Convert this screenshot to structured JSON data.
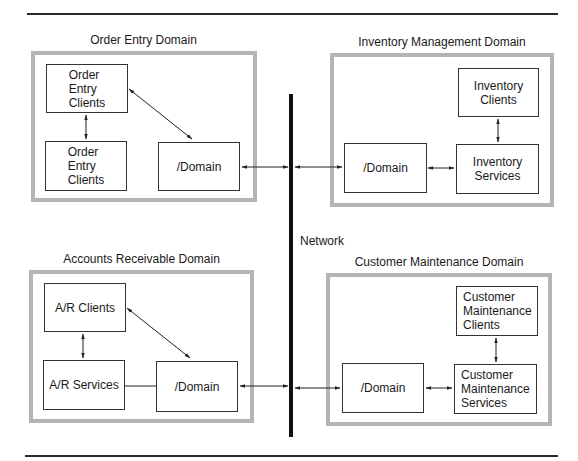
{
  "network": {
    "label": "Network"
  },
  "domains": {
    "order_entry": {
      "title": "Order Entry Domain",
      "nodes": {
        "clients_top": "Order\nEntry\nClients",
        "clients_bottom": "Order\nEntry\nClients",
        "domain": "/Domain"
      }
    },
    "inventory": {
      "title": "Inventory Management Domain",
      "nodes": {
        "clients": "Inventory\nClients",
        "services": "Inventory\nServices",
        "domain": "/Domain"
      }
    },
    "accounts_receivable": {
      "title": "Accounts Receivable Domain",
      "nodes": {
        "clients": "A/R Clients",
        "services": "A/R Services",
        "domain": "/Domain"
      }
    },
    "customer_maintenance": {
      "title": "Customer Maintenance Domain",
      "nodes": {
        "clients": "Customer\nMaintenance\nClients",
        "services": "Customer\nMaintenance\nServices",
        "domain": "/Domain"
      }
    }
  },
  "colors": {
    "domain_border": "#b4b4b4",
    "node_border": "#333333",
    "network_line": "#111111",
    "rule": "#2a2a2a"
  }
}
